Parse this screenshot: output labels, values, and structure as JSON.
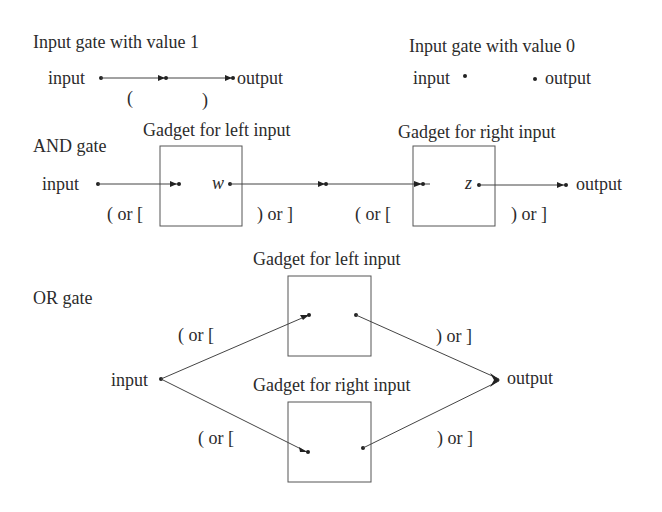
{
  "input_gate_1": {
    "title": "Input gate with value 1",
    "input_label": "input",
    "output_label": "output",
    "open_bracket": "(",
    "close_bracket": ")"
  },
  "input_gate_0": {
    "title": "Input gate with value 0",
    "input_label": "input",
    "output_label": "output"
  },
  "and_gate": {
    "title": "AND gate",
    "input_label": "input",
    "output_label": "output",
    "left_gadget_title": "Gadget for left input",
    "right_gadget_title": "Gadget for right input",
    "left_gadget_var": "w",
    "right_gadget_var": "z",
    "brackets": [
      "( or [",
      ") or ]",
      "( or [",
      ") or ]"
    ]
  },
  "or_gate": {
    "title": "OR gate",
    "input_label": "input",
    "output_label": "output",
    "top_gadget_title": "Gadget for left input",
    "bottom_gadget_title": "Gadget for right input",
    "brackets": [
      "( or [",
      ") or ]",
      "( or [",
      ") or ]"
    ]
  },
  "colors": {
    "line": "#444444",
    "box": "#555555",
    "text": "#2b2b2b"
  }
}
